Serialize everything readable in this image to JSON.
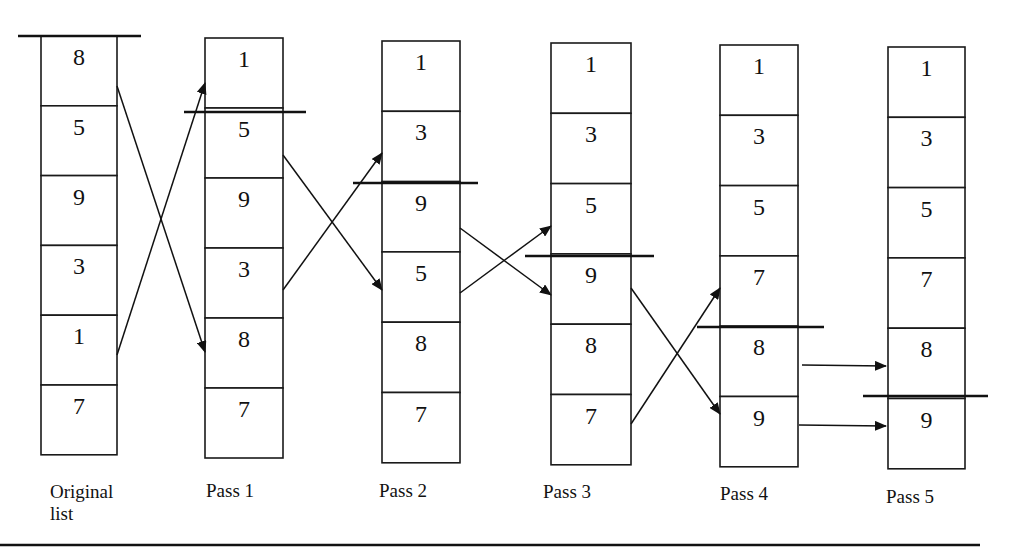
{
  "columns": [
    {
      "id": "original",
      "label_lines": [
        "Original",
        "list"
      ],
      "values": [
        "8",
        "5",
        "9",
        "3",
        "1",
        "7"
      ],
      "x": 41,
      "w": 76,
      "top": 36,
      "row_h": 69.8,
      "label_x": 50,
      "label_y": 498,
      "bar": {
        "y": 36,
        "x1": 18,
        "x2": 141
      }
    },
    {
      "id": "pass1",
      "label_lines": [
        "Pass 1"
      ],
      "values": [
        "1",
        "5",
        "9",
        "3",
        "8",
        "7"
      ],
      "x": 205,
      "w": 78,
      "top": 38,
      "row_h": 70,
      "label_x": 206,
      "label_y": 497,
      "bar": {
        "y": 112,
        "x1": 184,
        "x2": 306
      }
    },
    {
      "id": "pass2",
      "label_lines": [
        "Pass 2"
      ],
      "values": [
        "1",
        "3",
        "9",
        "5",
        "8",
        "7"
      ],
      "x": 382,
      "w": 78,
      "top": 41,
      "row_h": 70.3,
      "label_x": 379,
      "label_y": 497,
      "bar": {
        "y": 183,
        "x1": 353,
        "x2": 478
      }
    },
    {
      "id": "pass3",
      "label_lines": [
        "Pass 3"
      ],
      "values": [
        "1",
        "3",
        "5",
        "9",
        "8",
        "7"
      ],
      "x": 551,
      "w": 80,
      "top": 43,
      "row_h": 70.3,
      "label_x": 543,
      "label_y": 498,
      "bar": {
        "y": 256,
        "x1": 525,
        "x2": 654
      }
    },
    {
      "id": "pass4",
      "label_lines": [
        "Pass 4"
      ],
      "values": [
        "1",
        "3",
        "5",
        "7",
        "8",
        "9"
      ],
      "x": 720,
      "w": 78,
      "top": 45,
      "row_h": 70.3,
      "label_x": 720,
      "label_y": 500,
      "bar": {
        "y": 327,
        "x1": 697,
        "x2": 824
      }
    },
    {
      "id": "pass5",
      "label_lines": [
        "Pass 5"
      ],
      "values": [
        "1",
        "3",
        "5",
        "7",
        "8",
        "9"
      ],
      "x": 888,
      "w": 77,
      "top": 47,
      "row_h": 70.3,
      "label_x": 886,
      "label_y": 503,
      "bar": {
        "y": 396,
        "x1": 863,
        "x2": 988
      }
    }
  ],
  "arrows": [
    {
      "from": "original row 1 (8)",
      "to": "pass1 row 5",
      "x1": 117,
      "y1": 86,
      "x2": 205,
      "y2": 352
    },
    {
      "from": "original row 5 (1)",
      "to": "pass1 row 1",
      "x1": 117,
      "y1": 355,
      "x2": 205,
      "y2": 83
    },
    {
      "from": "pass1 row 2 (5)",
      "to": "pass2 row 4",
      "x1": 283,
      "y1": 155,
      "x2": 382,
      "y2": 290
    },
    {
      "from": "pass1 row 4 (3)",
      "to": "pass2 row 2",
      "x1": 283,
      "y1": 290,
      "x2": 382,
      "y2": 153
    },
    {
      "from": "pass2 row 3 (9)",
      "to": "pass3 row 4",
      "x1": 460,
      "y1": 228,
      "x2": 551,
      "y2": 295
    },
    {
      "from": "pass2 row 4 (5)",
      "to": "pass3 row 3",
      "x1": 460,
      "y1": 293,
      "x2": 551,
      "y2": 226
    },
    {
      "from": "pass3 row 4 (9)",
      "to": "pass4 row 6",
      "x1": 631,
      "y1": 288,
      "x2": 720,
      "y2": 414
    },
    {
      "from": "pass3 row 6 (7)",
      "to": "pass4 row 4",
      "x1": 631,
      "y1": 424,
      "x2": 720,
      "y2": 288
    },
    {
      "from": "pass4 row 5 (8)",
      "to": "pass5 row 5",
      "x1": 802,
      "y1": 365,
      "x2": 886,
      "y2": 366
    },
    {
      "from": "pass4 row 6 (9)",
      "to": "pass5 row 6",
      "x1": 799,
      "y1": 425,
      "x2": 886,
      "y2": 426
    }
  ],
  "bottom_rule": {
    "y": 545,
    "x1": 0,
    "x2": 980
  }
}
